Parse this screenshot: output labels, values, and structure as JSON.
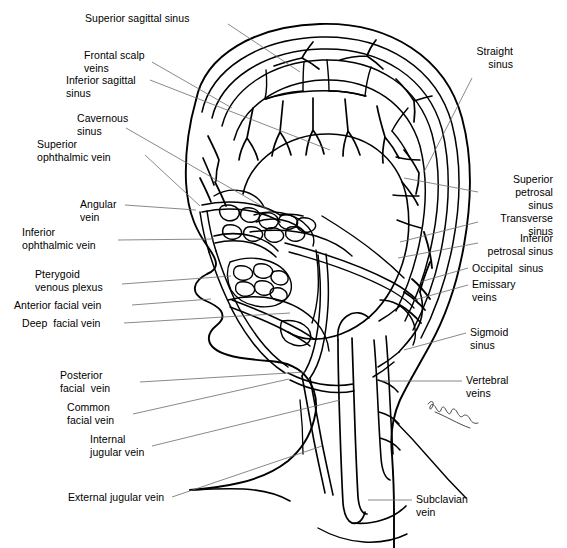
{
  "figure": {
    "signature": "artist-signature",
    "line_color": "#000000",
    "background_color": "#ffffff",
    "leader_color": "#555555"
  },
  "labels": {
    "superior_sagittal_sinus": "Superior sagittal sinus",
    "frontal_scalp_veins": "Frontal scalp\nveins",
    "inferior_sagittal_sinus": "Inferior sagittal\nsinus",
    "cavernous_sinus": "Cavernous\nsinus",
    "superior_ophthalmic_vein": "Superior\nophthalmic vein",
    "angular_vein": "Angular\nvein",
    "inferior_ophthalmic_vein": "Inferior\nophthalmic vein",
    "pterygoid_venous_plexus": "Pterygoid\nvenous plexus",
    "anterior_facial_vein": "Anterior facial vein",
    "deep_facial_vein": "Deep  facial vein",
    "posterior_facial_vein": "Posterior\nfacial  vein",
    "common_facial_vein": "Common\nfacial vein",
    "internal_jugular_vein": "Internal\njugular vein",
    "external_jugular_vein": "External jugular vein",
    "straight_sinus": "Straight\nsinus",
    "superior_petrosal_sinus": "Superior\npetrosal\nsinus",
    "transverse_sinus": "Transverse\nsinus",
    "inferior_petrosal_sinus": "Inferior\npetrosal sinus",
    "occipital_sinus": "Occipital  sinus",
    "emissary_veins": "Emissary\nveins",
    "sigmoid_sinus": "Sigmoid\nsinus",
    "vertebral_veins": "Vertebral\nveins",
    "subclavian_vein": "Subclavian\nvein"
  }
}
